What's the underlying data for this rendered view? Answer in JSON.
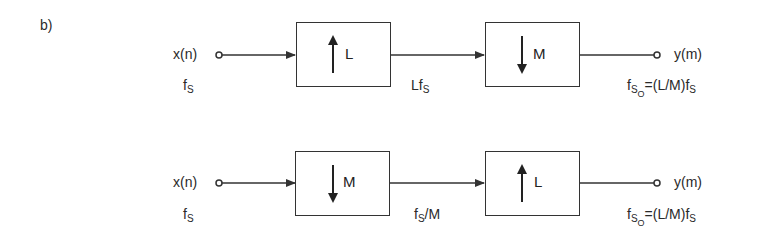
{
  "figure_label": "b)",
  "rows": [
    {
      "input": {
        "label": "x(n)",
        "rate_base": "f",
        "rate_sub": "S"
      },
      "blocks": [
        {
          "op": "upsample",
          "arrow": "up",
          "factor": "L"
        },
        {
          "op": "downsample",
          "arrow": "down",
          "factor": "M"
        }
      ],
      "intermediate_rate": {
        "pre": "Lf",
        "sub": "S",
        "post": ""
      },
      "output": {
        "label": "y(m)",
        "rate_base": "f",
        "rate_sub": "S",
        "rate_subsub": "O",
        "rate_expr": "=(L/M)f",
        "rate_expr_sub": "S"
      }
    },
    {
      "input": {
        "label": "x(n)",
        "rate_base": "f",
        "rate_sub": "S"
      },
      "blocks": [
        {
          "op": "downsample",
          "arrow": "down",
          "factor": "M"
        },
        {
          "op": "upsample",
          "arrow": "up",
          "factor": "L"
        }
      ],
      "intermediate_rate": {
        "pre": "f",
        "sub": "S",
        "post": "/M"
      },
      "output": {
        "label": "y(m)",
        "rate_base": "f",
        "rate_sub": "S",
        "rate_subsub": "O",
        "rate_expr": "=(L/M)f",
        "rate_expr_sub": "S"
      }
    }
  ]
}
